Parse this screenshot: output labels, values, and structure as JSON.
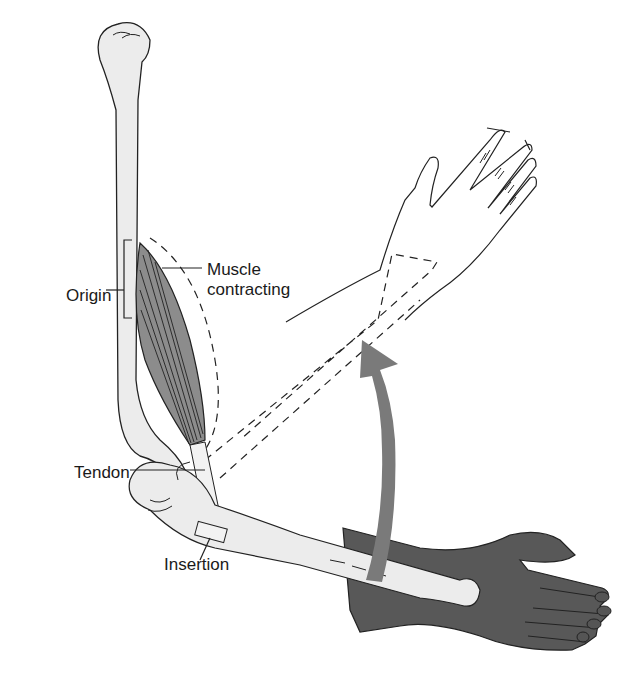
{
  "figure": {
    "labels": {
      "origin": "Origin",
      "muscle_line1": "Muscle",
      "muscle_line2": "contracting",
      "tendon": "Tendon",
      "insertion": "Insertion"
    },
    "colors": {
      "bone_fill": "#ececec",
      "outline": "#222222",
      "muscle_fill": "#8c8c8c",
      "arrow_fill": "#7a7a7a",
      "hand_dark": "#555555",
      "background": "#ffffff"
    },
    "elements": [
      "humerus",
      "biceps-muscle",
      "tendon",
      "ulna-radius",
      "forearm-dark-start-position",
      "forearm-outline-end-position",
      "motion-arrow"
    ]
  }
}
